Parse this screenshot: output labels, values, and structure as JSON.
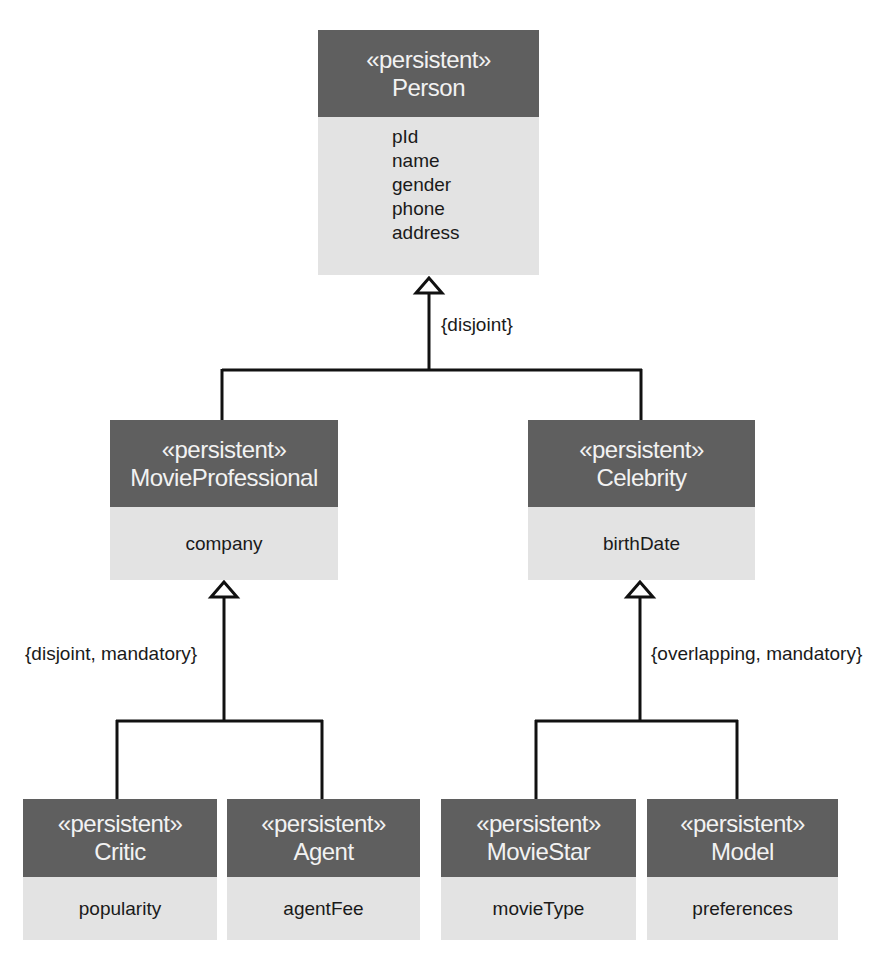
{
  "diagram": {
    "type": "UML class generalization hierarchy",
    "colors": {
      "header_bg": "#5f5f5f",
      "header_text": "#f2f2f2",
      "body_bg": "#e3e3e3",
      "body_text": "#1a1a1a",
      "line": "#111111"
    },
    "classes": {
      "person": {
        "stereotype": "«persistent»",
        "name": "Person",
        "attributes": [
          "pId",
          "name",
          "gender",
          "phone",
          "address"
        ]
      },
      "movie_professional": {
        "stereotype": "«persistent»",
        "name": "MovieProfessional",
        "attributes": [
          "company"
        ]
      },
      "celebrity": {
        "stereotype": "«persistent»",
        "name": "Celebrity",
        "attributes": [
          "birthDate"
        ]
      },
      "critic": {
        "stereotype": "«persistent»",
        "name": "Critic",
        "attributes": [
          "popularity"
        ]
      },
      "agent": {
        "stereotype": "«persistent»",
        "name": "Agent",
        "attributes": [
          "agentFee"
        ]
      },
      "movie_star": {
        "stereotype": "«persistent»",
        "name": "MovieStar",
        "attributes": [
          "movieType"
        ]
      },
      "model": {
        "stereotype": "«persistent»",
        "name": "Model",
        "attributes": [
          "preferences"
        ]
      }
    },
    "generalizations": [
      {
        "parent": "Person",
        "children": [
          "MovieProfessional",
          "Celebrity"
        ],
        "constraint": "{disjoint}"
      },
      {
        "parent": "MovieProfessional",
        "children": [
          "Critic",
          "Agent"
        ],
        "constraint": "{disjoint, mandatory}"
      },
      {
        "parent": "Celebrity",
        "children": [
          "MovieStar",
          "Model"
        ],
        "constraint": "{overlapping, mandatory}"
      }
    ]
  }
}
